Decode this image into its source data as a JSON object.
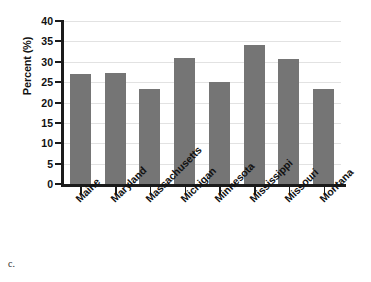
{
  "figure": {
    "caption_label": "c."
  },
  "chart_data": {
    "type": "bar",
    "title": "",
    "xlabel": "",
    "ylabel": "Percent (%)",
    "categories": [
      "Maine",
      "Maryland",
      "Massachusetts",
      "Michigan",
      "Minnesota",
      "Mississippi",
      "Missouri",
      "Montana"
    ],
    "values": [
      27.0,
      27.3,
      23.2,
      31.0,
      25.1,
      34.2,
      30.8,
      23.3
    ],
    "ylim": [
      0,
      40
    ],
    "yticks": [
      0,
      5,
      10,
      15,
      20,
      25,
      30,
      35,
      40
    ],
    "ytick_labels": [
      "0",
      "5",
      "10",
      "15",
      "20",
      "25",
      "30",
      "35",
      "40"
    ],
    "grid": true,
    "legend": false,
    "bar_color": "#757575",
    "grid_color": "#e2e2e2",
    "axis_color": "#1b1b1b"
  }
}
